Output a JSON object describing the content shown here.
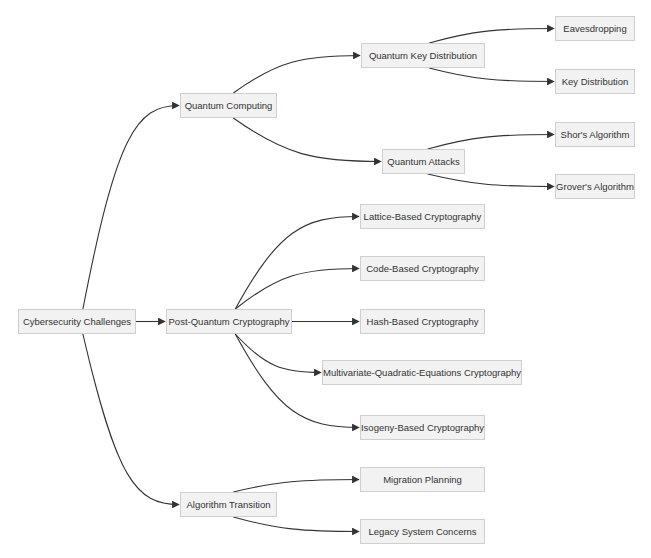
{
  "diagram": {
    "type": "mindmap-tree",
    "colors": {
      "node_fill": "#f2f2f2",
      "node_border": "#cfcfcf",
      "text": "#333333",
      "edge": "#333333"
    },
    "nodes": [
      {
        "id": "root",
        "label": "Cybersecurity Challenges",
        "x": 18,
        "y": 309,
        "w": 118,
        "h": 25
      },
      {
        "id": "qc",
        "label": "Quantum Computing",
        "x": 180,
        "y": 93,
        "w": 97,
        "h": 25
      },
      {
        "id": "pqc",
        "label": "Post-Quantum Cryptography",
        "x": 166,
        "y": 309,
        "w": 126,
        "h": 25
      },
      {
        "id": "at",
        "label": "Algorithm Transition",
        "x": 180,
        "y": 492,
        "w": 97,
        "h": 25
      },
      {
        "id": "qkd",
        "label": "Quantum Key Distribution",
        "x": 361,
        "y": 43,
        "w": 124,
        "h": 25
      },
      {
        "id": "qa",
        "label": "Quantum Attacks",
        "x": 382,
        "y": 149,
        "w": 83,
        "h": 25
      },
      {
        "id": "eav",
        "label": "Eavesdropping",
        "x": 555,
        "y": 16,
        "w": 80,
        "h": 25
      },
      {
        "id": "kd",
        "label": "Key Distribution",
        "x": 555,
        "y": 69,
        "w": 80,
        "h": 25
      },
      {
        "id": "shor",
        "label": "Shor's Algorithm",
        "x": 555,
        "y": 122,
        "w": 80,
        "h": 25
      },
      {
        "id": "grover",
        "label": "Grover's Algorithm",
        "x": 555,
        "y": 174,
        "w": 80,
        "h": 25
      },
      {
        "id": "lattice",
        "label": "Lattice-Based Cryptography",
        "x": 360,
        "y": 204,
        "w": 125,
        "h": 25
      },
      {
        "id": "code",
        "label": "Code-Based Cryptography",
        "x": 360,
        "y": 256,
        "w": 125,
        "h": 25
      },
      {
        "id": "hash",
        "label": "Hash-Based Cryptography",
        "x": 360,
        "y": 309,
        "w": 125,
        "h": 25
      },
      {
        "id": "mq",
        "label": "Multivariate-Quadratic-Equations Cryptography",
        "x": 322,
        "y": 360,
        "w": 200,
        "h": 25
      },
      {
        "id": "iso",
        "label": "Isogeny-Based Cryptography",
        "x": 360,
        "y": 415,
        "w": 125,
        "h": 25
      },
      {
        "id": "mig",
        "label": "Migration Planning",
        "x": 360,
        "y": 467,
        "w": 125,
        "h": 25
      },
      {
        "id": "leg",
        "label": "Legacy System Concerns",
        "x": 360,
        "y": 519,
        "w": 125,
        "h": 25
      }
    ],
    "edges": [
      {
        "from": "root",
        "to": "qc"
      },
      {
        "from": "root",
        "to": "pqc"
      },
      {
        "from": "root",
        "to": "at"
      },
      {
        "from": "qc",
        "to": "qkd"
      },
      {
        "from": "qc",
        "to": "qa"
      },
      {
        "from": "qkd",
        "to": "eav"
      },
      {
        "from": "qkd",
        "to": "kd"
      },
      {
        "from": "qa",
        "to": "shor"
      },
      {
        "from": "qa",
        "to": "grover"
      },
      {
        "from": "pqc",
        "to": "lattice"
      },
      {
        "from": "pqc",
        "to": "code"
      },
      {
        "from": "pqc",
        "to": "hash"
      },
      {
        "from": "pqc",
        "to": "mq"
      },
      {
        "from": "pqc",
        "to": "iso"
      },
      {
        "from": "at",
        "to": "mig"
      },
      {
        "from": "at",
        "to": "leg"
      }
    ]
  }
}
